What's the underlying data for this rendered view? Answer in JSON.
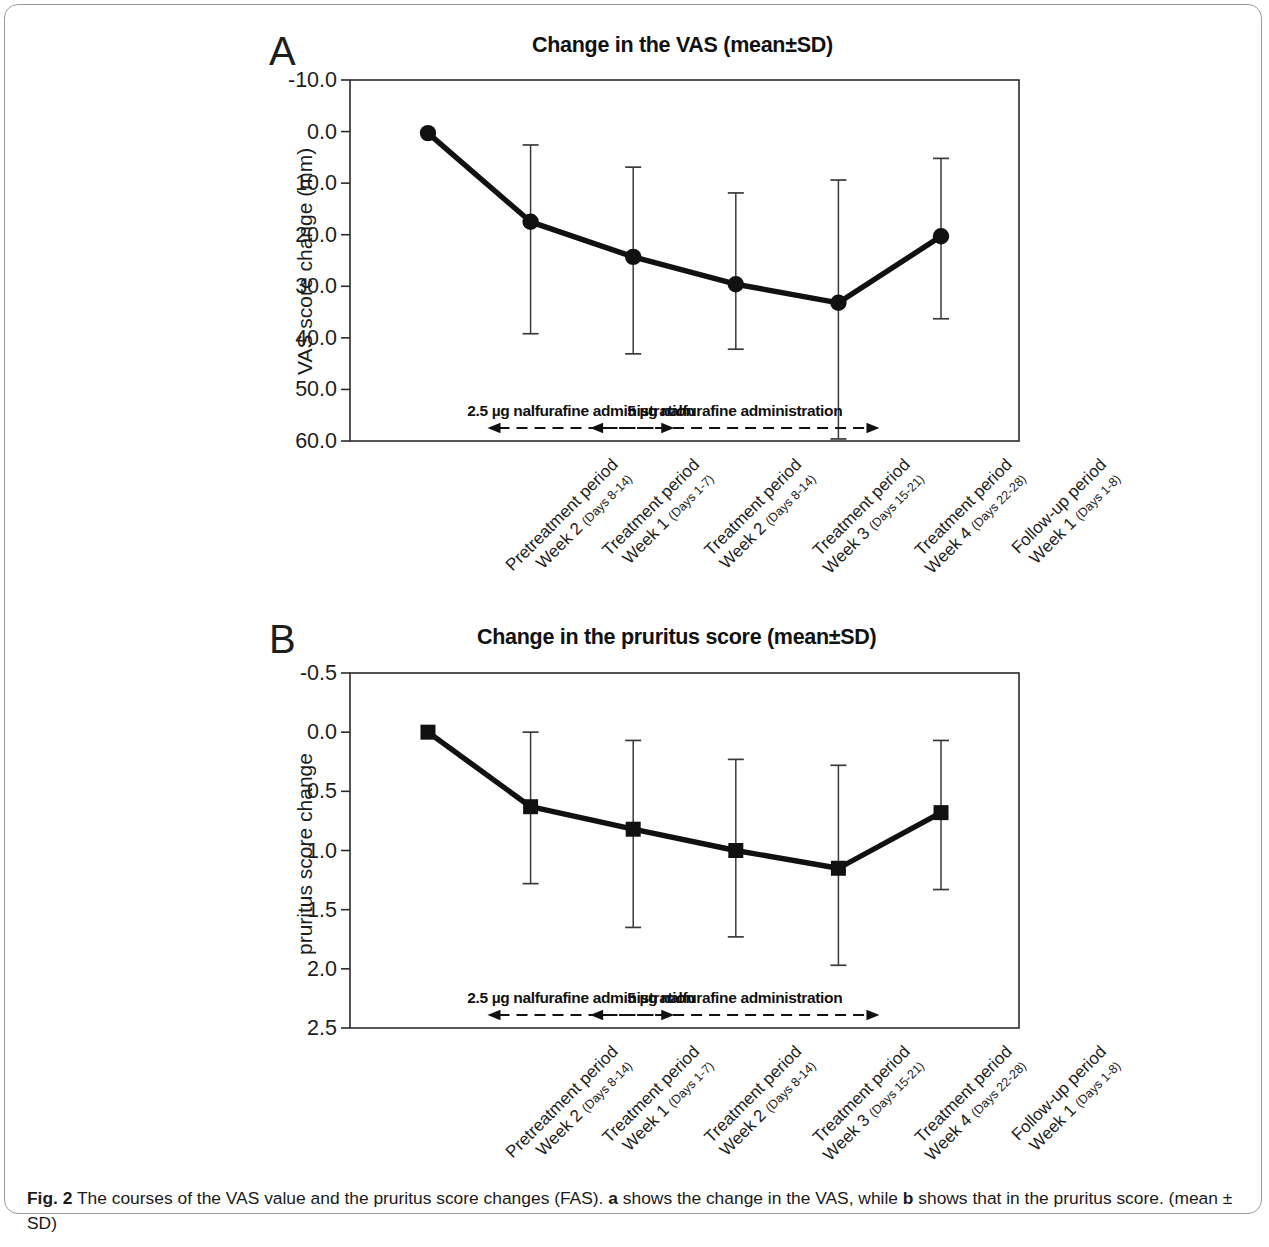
{
  "figure": {
    "caption_label": "Fig. 2",
    "caption_text": " The courses of the VAS value and the pruritus score changes (FAS). ",
    "caption_bold_a": "a",
    "caption_mid": " shows the change in the VAS, while ",
    "caption_bold_b": "b",
    "caption_end": " shows that in the pruritus score. (mean ± SD)"
  },
  "panel_a": {
    "letter": "A",
    "title": "Change in the VAS (mean±SD)",
    "annotation_1": "2.5 µg nalfurafine administration",
    "annotation_2": "5 µg nalfurafine administration"
  },
  "panel_b": {
    "letter": "B",
    "title": "Change in the pruritus score (mean±SD)",
    "annotation_1": "2.5 µg nalfurafine administration",
    "annotation_2": "5 µg nalfurafine administration"
  },
  "chart_data": [
    {
      "type": "line",
      "panel": "A",
      "title": "Change in the VAS (mean±SD)",
      "xlabel": "",
      "ylabel": "VAS score change (mm)",
      "ylim": [
        -10.0,
        60.0
      ],
      "y_inverted": true,
      "yticks": [
        -10.0,
        0.0,
        10.0,
        20.0,
        30.0,
        40.0,
        50.0,
        60.0
      ],
      "ytick_labels": [
        "-10.0",
        "0.0",
        "10.0",
        "20.0",
        "30.0",
        "40.0",
        "50.0",
        "60.0"
      ],
      "grid": false,
      "legend": false,
      "marker": "circle",
      "categories": [
        "Pretreatment period Week 2 (Days 8-14)",
        "Treatment period Week 1 (Days 1-7)",
        "Treatment period Week 2 (Days 8-14)",
        "Treatment period Week 3 (Days 15-21)",
        "Treatment period Week 4 (Days 22-28)",
        "Follow-up period Week 1 (Days 1-8)"
      ],
      "categories_multiline": [
        {
          "line1": "Pretreatment period",
          "line2": "Week 2 ",
          "sub": "(Days 8-14)"
        },
        {
          "line1": "Treatment period",
          "line2": "Week 1 ",
          "sub": "(Days 1-7)"
        },
        {
          "line1": "Treatment period",
          "line2": "Week 2 ",
          "sub": "(Days 8-14)"
        },
        {
          "line1": "Treatment period",
          "line2": "Week 3 ",
          "sub": "(Days 15-21)"
        },
        {
          "line1": "Treatment period",
          "line2": "Week 4 ",
          "sub": "(Days 22-28)"
        },
        {
          "line1": "Follow-up period",
          "line2": "Week 1 ",
          "sub": "(Days 1-8)"
        }
      ],
      "values": [
        0.3,
        17.5,
        24.3,
        29.6,
        33.2,
        20.3
      ],
      "err_low": [
        0.3,
        2.6,
        6.9,
        11.9,
        9.4,
        5.2
      ],
      "err_high": [
        0.3,
        39.2,
        43.1,
        42.2,
        59.6,
        36.3
      ],
      "annotations": [
        {
          "text": "2.5 µg nalfurafine administration",
          "from_category": 1,
          "to_category": 2,
          "style": "dashed-double-arrow"
        },
        {
          "text": "5 µg nalfurafine administration",
          "from_category": 2,
          "to_category": 4,
          "style": "dashed-double-arrow"
        }
      ]
    },
    {
      "type": "line",
      "panel": "B",
      "title": "Change in the pruritus score (mean±SD)",
      "xlabel": "",
      "ylabel": "pruritus score change",
      "ylim": [
        -0.5,
        2.5
      ],
      "y_inverted": true,
      "yticks": [
        -0.5,
        0.0,
        0.5,
        1.0,
        1.5,
        2.0,
        2.5
      ],
      "ytick_labels": [
        "-0.5",
        "0.0",
        "0.5",
        "1.0",
        "1.5",
        "2.0",
        "2.5"
      ],
      "grid": false,
      "legend": false,
      "marker": "square",
      "categories": [
        "Pretreatment period Week 2 (Days 8-14)",
        "Treatment period Week 1 (Days 1-7)",
        "Treatment period Week 2 (Days 8-14)",
        "Treatment period Week 3 (Days 15-21)",
        "Treatment period Week 4 (Days 22-28)",
        "Follow-up period Week 1 (Days 1-8)"
      ],
      "categories_multiline": [
        {
          "line1": "Pretreatment period",
          "line2": "Week 2 ",
          "sub": "(Days 8-14)"
        },
        {
          "line1": "Treatment period",
          "line2": "Week 1 ",
          "sub": "(Days 1-7)"
        },
        {
          "line1": "Treatment period",
          "line2": "Week 2 ",
          "sub": "(Days 8-14)"
        },
        {
          "line1": "Treatment period",
          "line2": "Week 3 ",
          "sub": "(Days 15-21)"
        },
        {
          "line1": "Treatment period",
          "line2": "Week 4 ",
          "sub": "(Days 22-28)"
        },
        {
          "line1": "Follow-up period",
          "line2": "Week 1 ",
          "sub": "(Days 1-8)"
        }
      ],
      "values": [
        0.0,
        0.63,
        0.82,
        1.0,
        1.15,
        0.68
      ],
      "err_low": [
        0.0,
        0.0,
        0.07,
        0.23,
        0.28,
        0.07
      ],
      "err_high": [
        0.0,
        1.28,
        1.65,
        1.73,
        1.97,
        1.33
      ],
      "annotations": [
        {
          "text": "2.5 µg nalfurafine administration",
          "from_category": 1,
          "to_category": 2,
          "style": "dashed-double-arrow"
        },
        {
          "text": "5 µg nalfurafine administration",
          "from_category": 2,
          "to_category": 4,
          "style": "dashed-double-arrow"
        }
      ]
    }
  ]
}
